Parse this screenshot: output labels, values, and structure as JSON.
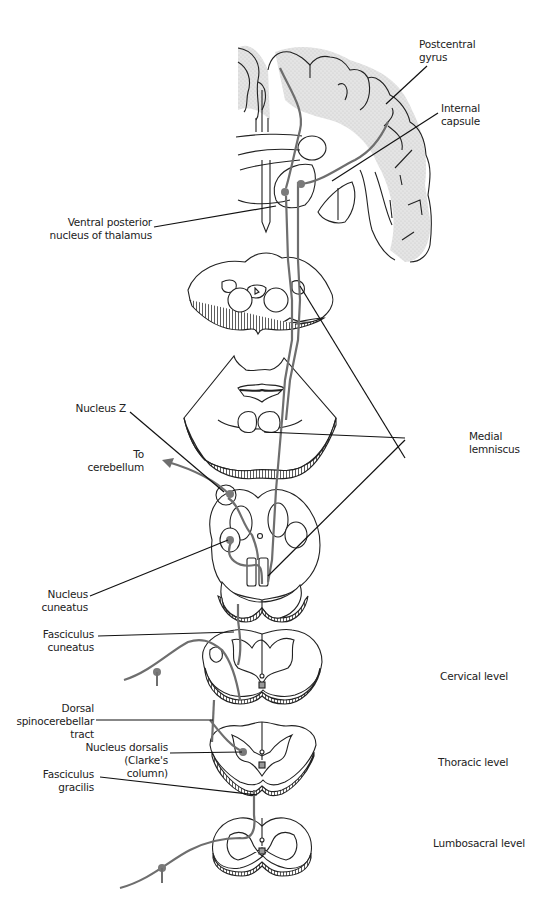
{
  "figure": {
    "colors": {
      "outline": "#222222",
      "pathway": "#6e6e6e",
      "cortex_shading": "#dcdcdc",
      "neuron_soma": "#7a7a7a",
      "background": "#ffffff"
    }
  },
  "labels": {
    "postcentral_gyrus": [
      "Postcentral",
      "gyrus"
    ],
    "internal_capsule": [
      "Internal",
      "capsule"
    ],
    "vpl_thalamus": [
      "Ventral posterior",
      "nucleus of thalamus"
    ],
    "nucleus_z": [
      "Nucleus Z"
    ],
    "to_cerebellum": [
      "To",
      "cerebellum"
    ],
    "medial_lemniscus": [
      "Medial",
      "lemniscus"
    ],
    "nucleus_cuneatus": [
      "Nucleus",
      "cuneatus"
    ],
    "fasciculus_cuneatus": [
      "Fasciculus",
      "cuneatus"
    ],
    "dorsal_spinocerebellar_tract": [
      "Dorsal",
      "spinocerebellar",
      "tract"
    ],
    "nucleus_dorsalis": [
      "Nucleus dorsalis",
      "(Clarke's column)"
    ],
    "fasciculus_gracilis": [
      "Fasciculus",
      "gracilis"
    ],
    "cervical_level": [
      "Cervical level"
    ],
    "thoracic_level": [
      "Thoracic level"
    ],
    "lumbosacral_level": [
      "Lumbosacral level"
    ]
  }
}
